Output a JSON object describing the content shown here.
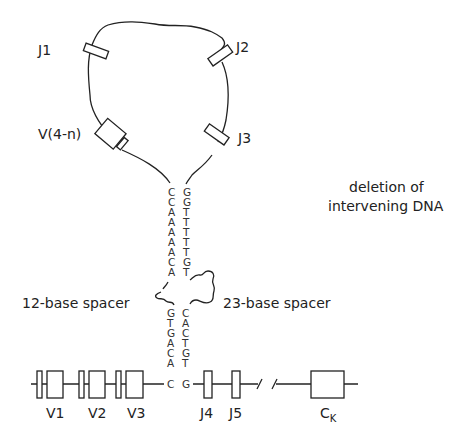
{
  "diagram": {
    "loop_labels": {
      "j1": "J1",
      "j2": "J2",
      "j3": "J3",
      "v4n": "V(4-n)"
    },
    "annotation": {
      "line1": "deletion of",
      "line2": "intervening DNA"
    },
    "spacers": {
      "left": "12-base spacer",
      "right": "23-base spacer"
    },
    "heptamer_top": {
      "left": [
        "C",
        "C",
        "A",
        "A",
        "A",
        "A",
        "A",
        "C",
        "A"
      ],
      "right": [
        "G",
        "G",
        "T",
        "T",
        "T",
        "T",
        "T",
        "G",
        "T"
      ]
    },
    "heptamer_bottom": {
      "left": [
        "G",
        "T",
        "G",
        "A",
        "C",
        "A",
        "C"
      ],
      "right": [
        "C",
        "A",
        "C",
        "T",
        "G",
        "T",
        "G"
      ]
    },
    "genome_labels": {
      "v1": "V1",
      "v2": "V2",
      "v3": "V3",
      "j4": "J4",
      "j5": "J5",
      "ck_main": "C",
      "ck_sub": "K"
    }
  }
}
